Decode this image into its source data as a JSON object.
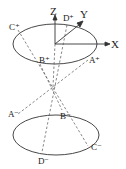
{
  "diagram": {
    "type": "double-cone geometry",
    "axes": {
      "x": "X",
      "y": "Y",
      "z": "Z"
    },
    "top_points": {
      "a": "A⁺",
      "b": "B⁺",
      "c": "C⁺",
      "d": "D⁺"
    },
    "bottom_points": {
      "a": "A⁻",
      "b": "B⁻",
      "c": "C⁻",
      "d": "D⁻"
    },
    "colors": {
      "line": "#333333",
      "background": "#ffffff"
    }
  }
}
